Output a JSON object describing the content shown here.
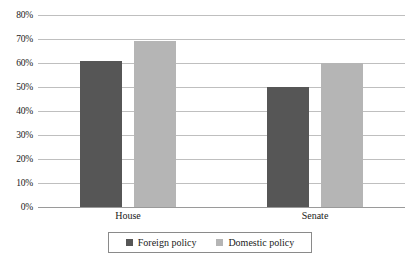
{
  "chart_data": {
    "type": "bar",
    "title": "",
    "subtitle": "",
    "xlabel": "",
    "ylabel": "",
    "categories": [
      "House",
      "Senate"
    ],
    "series": [
      {
        "name": "Foreign policy",
        "values": [
          61,
          50
        ],
        "color": "#565656"
      },
      {
        "name": "Domestic policy",
        "values": [
          69,
          60
        ],
        "color": "#b5b5b5"
      }
    ],
    "grouped_values": {
      "House": {
        "Foreign policy": 61,
        "Domestic policy": 50
      },
      "Senate": {
        "Foreign policy": 69,
        "Domestic policy": 60
      }
    },
    "ylim": [
      0,
      80
    ],
    "ytick_step": 10,
    "ytick_labels": [
      "80%",
      "70%",
      "60%",
      "50%",
      "40%",
      "30%",
      "20%",
      "10%",
      "0%"
    ],
    "ytick_values": [
      80,
      70,
      60,
      50,
      40,
      30,
      20,
      10,
      0
    ],
    "grid": true,
    "grid_axis": "y",
    "legend_position": "bottom",
    "value_format": "percent"
  },
  "axis": {
    "y": {
      "t80": "80%",
      "t70": "70%",
      "t60": "60%",
      "t50": "50%",
      "t40": "40%",
      "t30": "30%",
      "t20": "20%",
      "t10": "10%",
      "t0": "0%"
    },
    "x": {
      "cat0": "House",
      "cat1": "Senate"
    }
  },
  "legend": {
    "entries": [
      {
        "label": "Foreign policy",
        "color": "#565656"
      },
      {
        "label": "Domestic policy",
        "color": "#b5b5b5"
      }
    ]
  },
  "colors": {
    "series_dark": "#565656",
    "series_light": "#b5b5b5",
    "gridline": "#bfbfbf",
    "baseline": "#9a9a9a",
    "legend_border": "#8a8a8a",
    "text": "#1a1a1a",
    "background": "#ffffff"
  }
}
